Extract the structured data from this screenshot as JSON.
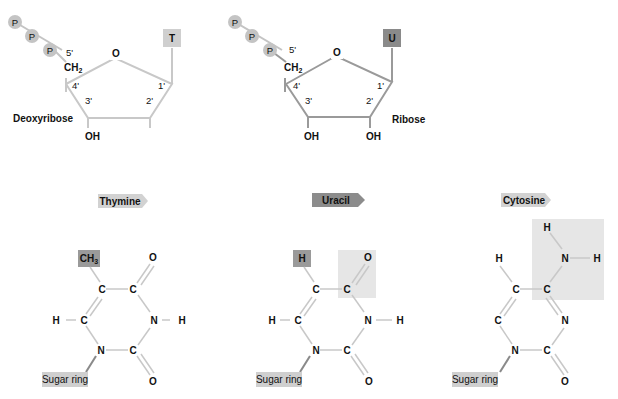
{
  "colors": {
    "deoxy_bond": "#c8c8c8",
    "ribose_bond": "#9a9a9a",
    "phosphate": "#c4c4c4",
    "T_box": "#cfcfcf",
    "U_box": "#8a8a8a",
    "highlight_light": "#e6e6e6",
    "highlight_mid": "#9a9a9a",
    "tag_light": "#d2d2d2",
    "tag_dark": "#8c8c8c",
    "ring_bond": "#c8c8c8",
    "sugar_ring_box": "#cfcfcf"
  },
  "deoxyribose": {
    "phosphates": [
      "P",
      "P",
      "P"
    ],
    "base": "T",
    "name": "Deoxyribose",
    "primes": [
      "5'",
      "4'",
      "3'",
      "2'",
      "1'"
    ],
    "atoms": {
      "o": "O",
      "ch2": "CH",
      "ch2_sub": "2",
      "oh": "OH"
    }
  },
  "ribose": {
    "phosphates": [
      "P",
      "P",
      "P"
    ],
    "base": "U",
    "name": "Ribose",
    "primes": [
      "5'",
      "4'",
      "3'",
      "2'",
      "1'"
    ],
    "atoms": {
      "o": "O",
      "ch2": "CH",
      "ch2_sub": "2",
      "oh3": "OH",
      "oh2": "OH"
    }
  },
  "thymine": {
    "tag": "Thymine",
    "sub": "CH",
    "sub_sub": "3",
    "atoms": {
      "c5": "C",
      "c4": "C",
      "o4": "O",
      "c6": "C",
      "h6": "H",
      "n3": "N",
      "h3": "H",
      "n1": "N",
      "c2": "C",
      "o2": "O"
    },
    "sugar": "Sugar ring"
  },
  "uracil": {
    "tag": "Uracil",
    "sub": "H",
    "atoms": {
      "c5": "C",
      "c4": "C",
      "o4": "O",
      "c6": "C",
      "h6": "H",
      "n3": "N",
      "h3": "H",
      "n1": "N",
      "c2": "C",
      "o2": "O"
    },
    "sugar": "Sugar ring"
  },
  "cytosine": {
    "tag": "Cytosine",
    "atoms": {
      "h5": "H",
      "c5": "C",
      "c4": "C",
      "n4": "N",
      "h4a": "H",
      "h4b": "H",
      "c6": "C",
      "n3": "N",
      "n1": "N",
      "c2": "C",
      "o2": "O"
    },
    "sugar": "Sugar ring"
  }
}
